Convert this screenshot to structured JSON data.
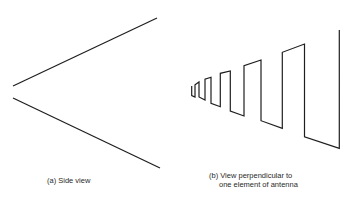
{
  "figure": {
    "panel_a": {
      "caption": "(a) Side view",
      "upper_line": {
        "x1": 13,
        "y1": 86,
        "x2": 157,
        "y2": 18
      },
      "lower_line": {
        "x1": 13,
        "y1": 98,
        "x2": 160,
        "y2": 168
      }
    },
    "panel_b": {
      "caption_line1": "(b) View perpendicular to",
      "caption_line2": "one element of antenna",
      "zigzag_points": "191.7,86 191.7,95.5 195,97 195,84.7 199,82 199,97 205,100 205,79.3 211,77.3 211,103.3 220.3,106.7 220.3,73.3 230.3,71 230.3,111 244,116 244,65.7 261,60 261,120.7 282.3,128.3 282.3,52.3 304.5,44 304.5,136.7 339.3,148.3 339.3,30"
    },
    "stroke_color": "#1e1e1e"
  }
}
